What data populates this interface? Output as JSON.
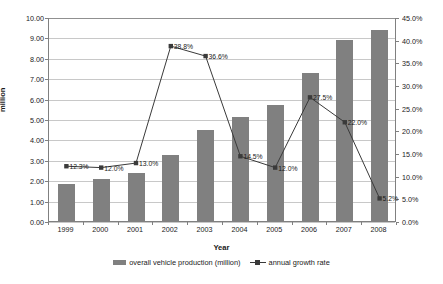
{
  "chart_data": {
    "type": "bar",
    "title": "",
    "xlabel": "Year",
    "ylabel": "million",
    "ylabel_right": "",
    "categories": [
      "1999",
      "2000",
      "2001",
      "2002",
      "2003",
      "2004",
      "2005",
      "2006",
      "2007",
      "2008"
    ],
    "ylim": [
      0,
      10
    ],
    "ylim_right": [
      0,
      0.45
    ],
    "grid": true,
    "legend_position": "bottom",
    "series": [
      {
        "name": "overall vehicle production (million)",
        "type": "bar",
        "axis": "left",
        "color": "#808080",
        "values": [
          1.83,
          2.07,
          2.34,
          3.25,
          4.44,
          5.08,
          5.71,
          7.28,
          8.88,
          9.34
        ]
      },
      {
        "name": "annual growth rate",
        "type": "line",
        "axis": "right",
        "color": "#3a3a3a",
        "values": [
          0.123,
          0.12,
          0.13,
          0.388,
          0.366,
          0.145,
          0.12,
          0.275,
          0.22,
          0.052
        ],
        "labels": [
          "12.3%",
          "12.0%",
          "13.0%",
          "38.8%",
          "36.6%",
          "14.5%",
          "12.0%",
          "27.5%",
          "22.0%",
          "5.2%"
        ]
      }
    ],
    "yticks_left": [
      "0.00",
      "1.00",
      "2.00",
      "3.00",
      "4.00",
      "5.00",
      "6.00",
      "7.00",
      "8.00",
      "9.00",
      "10.00"
    ],
    "yticks_right": [
      "0.0%",
      "5.0%",
      "10.0%",
      "15.0%",
      "20.0%",
      "25.0%",
      "30.0%",
      "35.0%",
      "40.0%",
      "45.0%"
    ]
  }
}
